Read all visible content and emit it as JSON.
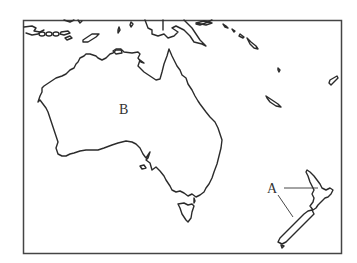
{
  "map": {
    "title": "",
    "region": "Australia and New Zealand outline map",
    "labels": [
      {
        "id": "B",
        "text": "B",
        "target": "Australia (interior)"
      },
      {
        "id": "A",
        "text": "A",
        "target": "New Zealand (North and South Island)"
      }
    ],
    "colors": {
      "background": "#ffffff",
      "coastline": "#2b2b2b",
      "frame": "#444444"
    }
  }
}
